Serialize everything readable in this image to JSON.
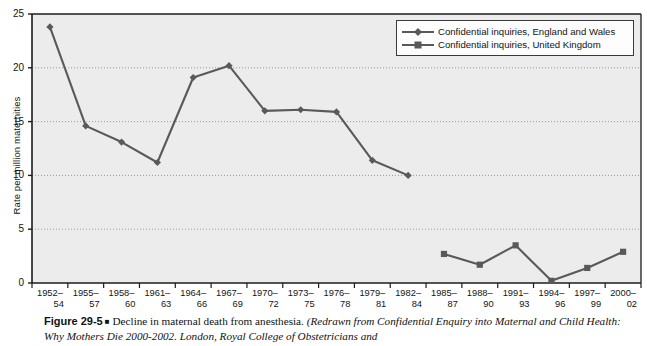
{
  "figure": {
    "caption_number": "Figure 29-5",
    "caption_bullet": "■",
    "caption_main": "Decline in maternal death from anesthesia.",
    "caption_source": "(Redrawn from Confidential Enquiry into Maternal and Child Health: Why Mothers Die 2000-2002. London, Royal College of Obstetricians and"
  },
  "colors": {
    "series": "#595959",
    "plot_background": "#ececec",
    "gridline": "#9a9a9a",
    "axis": "#1c1c1c",
    "legend_background": "#fdfdfd",
    "legend_border": "#3a3a3a",
    "text": "#141414"
  },
  "chart_data": {
    "type": "line",
    "title": "",
    "xlabel": "",
    "ylabel": "Rate per million maternities",
    "ylim": [
      0,
      25
    ],
    "yticks": [
      0,
      5,
      10,
      15,
      20,
      25
    ],
    "grid": true,
    "legend_position": "top-right",
    "categories": [
      "1952–54",
      "1955–57",
      "1958–60",
      "1961–63",
      "1964–66",
      "1967–69",
      "1970–72",
      "1973–75",
      "1976–78",
      "1979–81",
      "1982–84",
      "1985–87",
      "1988–90",
      "1991–93",
      "1994–96",
      "1997–99",
      "2000–02"
    ],
    "category_lines": [
      [
        "1952–",
        "54"
      ],
      [
        "1955–",
        "57"
      ],
      [
        "1958–",
        "60"
      ],
      [
        "1961–",
        "63"
      ],
      [
        "1964–",
        "66"
      ],
      [
        "1967–",
        "69"
      ],
      [
        "1970–",
        "72"
      ],
      [
        "1973–",
        "75"
      ],
      [
        "1976–",
        "78"
      ],
      [
        "1979–",
        "81"
      ],
      [
        "1982–",
        "84"
      ],
      [
        "1985–",
        "87"
      ],
      [
        "1988–",
        "90"
      ],
      [
        "1991–",
        "93"
      ],
      [
        "1994–",
        "96"
      ],
      [
        "1997–",
        "99"
      ],
      [
        "2000–",
        "02"
      ]
    ],
    "series": [
      {
        "name": "Confidential inquiries, England and Wales",
        "marker": "diamond",
        "values": [
          23.8,
          14.6,
          13.1,
          11.2,
          19.1,
          20.2,
          16.0,
          16.1,
          15.9,
          11.4,
          10.0,
          null,
          null,
          null,
          null,
          null,
          null
        ]
      },
      {
        "name": "Confidential inquiries, United Kingdom",
        "marker": "square",
        "values": [
          null,
          null,
          null,
          null,
          null,
          null,
          null,
          null,
          null,
          null,
          null,
          2.7,
          1.7,
          3.5,
          0.2,
          1.4,
          2.9
        ]
      }
    ]
  }
}
